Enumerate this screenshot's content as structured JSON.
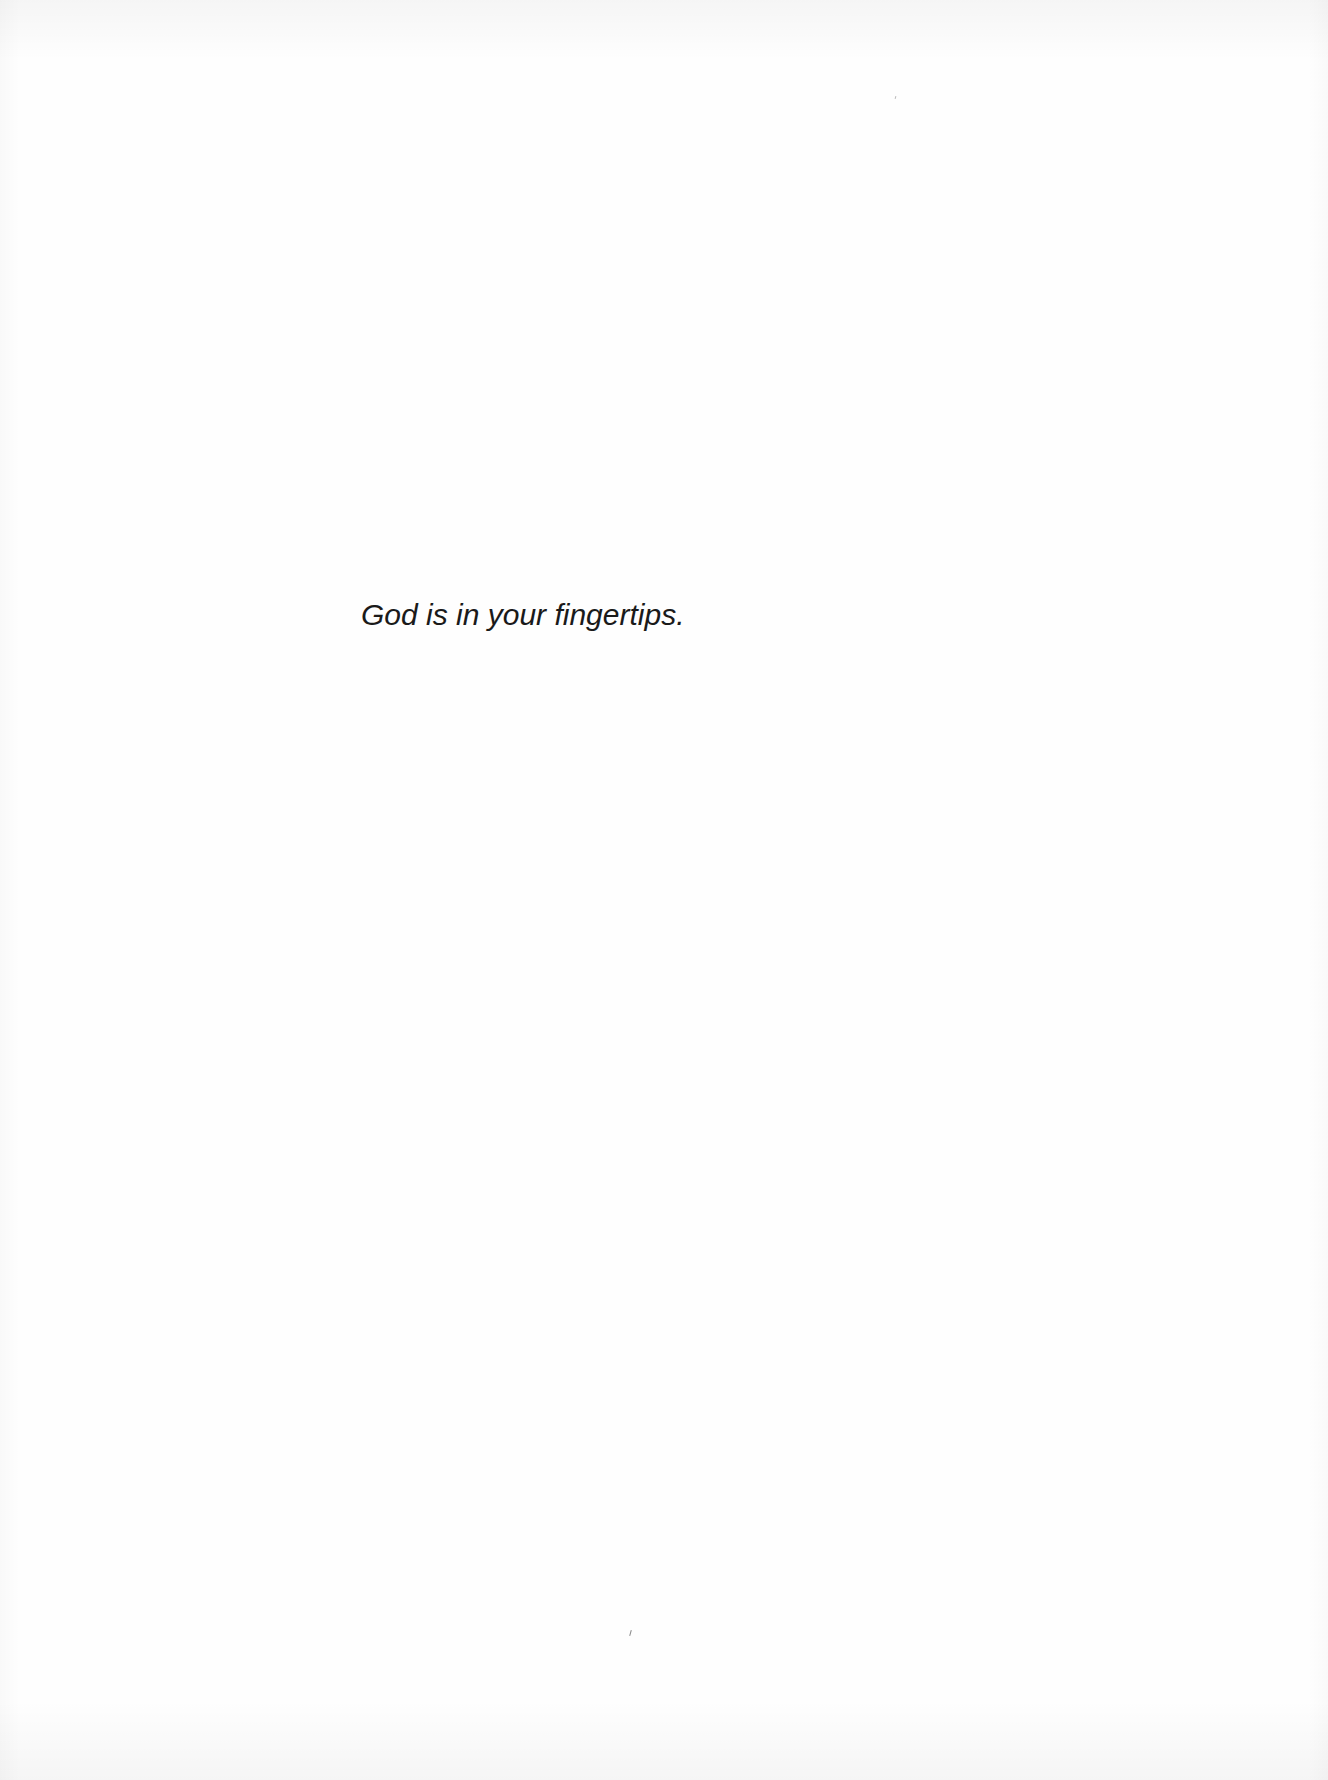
{
  "document": {
    "body_lines": [
      "God is in your fingertips."
    ],
    "text_color": "#1a1a1a",
    "paper_color": "#fefefe"
  }
}
